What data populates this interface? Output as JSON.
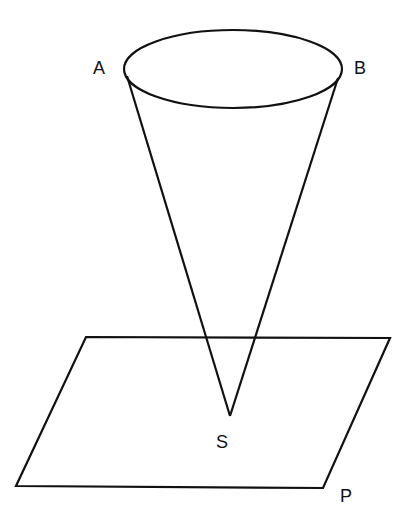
{
  "figure": {
    "labels": {
      "A": "A",
      "B": "B",
      "S": "S",
      "P": "P"
    },
    "stroke_color": "#111111",
    "background": "#ffffff"
  }
}
